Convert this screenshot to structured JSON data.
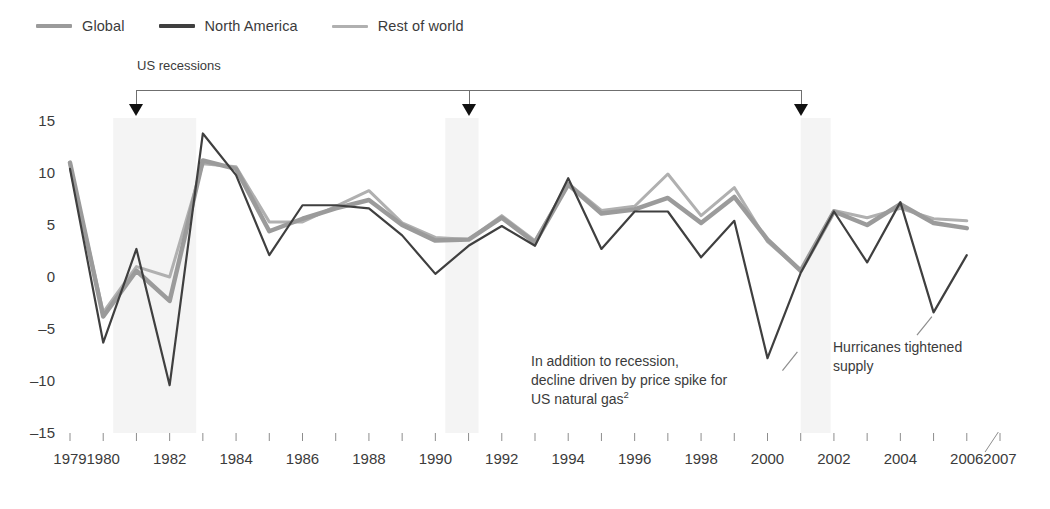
{
  "legend": {
    "items": [
      {
        "label": "Global",
        "color": "#9b9b9b",
        "width": 4
      },
      {
        "label": "North America",
        "color": "#3f3f3f",
        "width": 4
      },
      {
        "label": "Rest of world",
        "color": "#b0b0b0",
        "width": 3
      }
    ]
  },
  "recession": {
    "label": "US recessions",
    "marker_years": [
      1981,
      1991,
      2001
    ]
  },
  "annotations": [
    {
      "name": "gas-price-annotation",
      "lines": [
        "In addition to recession,",
        "decline driven by price spike for",
        "US natural gas"
      ],
      "superscript": "2"
    },
    {
      "name": "hurricanes-annotation",
      "lines": [
        "Hurricanes tightened",
        "supply"
      ],
      "superscript": ""
    }
  ],
  "axes": {
    "y_ticks": [
      "15",
      "10",
      "5",
      "0",
      "-5",
      "-10",
      "-15"
    ],
    "x_ticks": [
      "1979",
      "1980",
      "1982",
      "1984",
      "1986",
      "1988",
      "1990",
      "1992",
      "1994",
      "1996",
      "1998",
      "2000",
      "2002",
      "2004",
      "2006",
      "2007"
    ]
  },
  "chart_data": {
    "type": "line",
    "title": "",
    "subtitle": "",
    "xlabel": "",
    "ylabel": "",
    "ylim": [
      -15,
      15
    ],
    "xlim": [
      1979,
      2007
    ],
    "grid": false,
    "legend_position": "top-left",
    "x": [
      1979,
      1980,
      1981,
      1982,
      1983,
      1984,
      1985,
      1986,
      1987,
      1988,
      1989,
      1990,
      1991,
      1992,
      1993,
      1994,
      1995,
      1996,
      1997,
      1998,
      1999,
      2000,
      2001,
      2002,
      2003,
      2004,
      2005,
      2006
    ],
    "series": [
      {
        "name": "Global",
        "color": "#9b9b9b",
        "width": 4.5,
        "values": [
          11.0,
          -3.8,
          0.6,
          -2.3,
          11.2,
          10.4,
          4.4,
          5.6,
          6.6,
          7.4,
          5.0,
          3.5,
          3.6,
          5.7,
          3.3,
          8.9,
          6.1,
          6.5,
          7.6,
          5.2,
          7.7,
          3.6,
          0.6,
          6.3,
          5.0,
          7.0,
          5.2,
          4.7
        ]
      },
      {
        "name": "North America",
        "color": "#3f3f3f",
        "width": 2.2,
        "values": [
          10.4,
          -6.3,
          2.7,
          -10.4,
          13.8,
          9.8,
          2.1,
          6.9,
          6.9,
          6.6,
          4.0,
          0.3,
          3.0,
          4.9,
          3.0,
          9.5,
          2.7,
          6.3,
          6.3,
          1.9,
          5.4,
          -7.8,
          0.4,
          6.3,
          1.4,
          7.2,
          -3.4,
          2.1
        ]
      },
      {
        "name": "Rest of world",
        "color": "#b0b0b0",
        "width": 3.0,
        "values": [
          10.8,
          -3.4,
          1.0,
          0.0,
          10.9,
          10.6,
          5.3,
          5.3,
          6.8,
          8.3,
          5.2,
          3.8,
          3.6,
          5.9,
          3.5,
          9.0,
          6.4,
          6.8,
          9.9,
          5.9,
          8.6,
          3.4,
          0.6,
          6.4,
          5.7,
          6.6,
          5.6,
          5.4
        ]
      }
    ],
    "recession_bands": [
      {
        "start": 1980.3,
        "end": 1982.8
      },
      {
        "start": 1990.3,
        "end": 1991.3
      },
      {
        "start": 2001.0,
        "end": 2001.9
      }
    ],
    "annotation_targets": [
      {
        "name": "gas-price-annotation",
        "year": 2001,
        "value": -7.8
      },
      {
        "name": "hurricanes-annotation",
        "year": 2005,
        "value": -3.4
      }
    ]
  }
}
